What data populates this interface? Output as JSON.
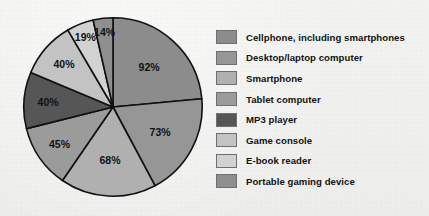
{
  "chart_data": {
    "type": "pie",
    "title": "",
    "subtitle": "",
    "xlabel": "",
    "ylabel": "",
    "grid": false,
    "legend_position": "right",
    "note": "Percent of adults who own each device; slices drawn clockwise starting at 12 o'clock, sized proportional to the percentage values.",
    "categories": [
      "Cellphone, including smartphones",
      "Desktop/laptop computer",
      "Smartphone",
      "Tablet computer",
      "MP3 player",
      "Game console",
      "E-book reader",
      "Portable gaming device"
    ],
    "values": [
      92,
      73,
      68,
      45,
      40,
      40,
      19,
      14
    ],
    "data_labels": [
      "92%",
      "73%",
      "68%",
      "45%",
      "40%",
      "40%",
      "19%",
      "14%"
    ],
    "colors": [
      "#8c8c8c",
      "#969696",
      "#b0b0b0",
      "#9b9b9b",
      "#565656",
      "#c3c3c3",
      "#d2d2d2",
      "#8f8f8f"
    ]
  },
  "legend": {
    "items": [
      {
        "label": "Cellphone, including smartphones",
        "color": "#8c8c8c"
      },
      {
        "label": "Desktop/laptop computer",
        "color": "#969696"
      },
      {
        "label": "Smartphone",
        "color": "#b0b0b0"
      },
      {
        "label": "Tablet computer",
        "color": "#9b9b9b"
      },
      {
        "label": "MP3 player",
        "color": "#565656"
      },
      {
        "label": "Game console",
        "color": "#c3c3c3"
      },
      {
        "label": "E-book reader",
        "color": "#d2d2d2"
      },
      {
        "label": "Portable gaming device",
        "color": "#8f8f8f"
      }
    ]
  },
  "style": {
    "background": "#f2f2f0",
    "slice_outline": "#111111",
    "label_text": "#111111"
  }
}
